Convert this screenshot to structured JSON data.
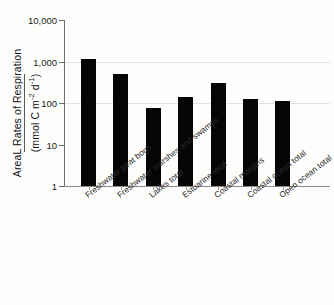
{
  "chart_data": {
    "type": "bar",
    "title": "",
    "subtitle": "",
    "xlabel": "",
    "ylabel": "AreaL Rates of Respiration (mmol C m-2 d-1)",
    "ylabel_line1": "AreaL Rates of Respiration",
    "ylabel_line2_prefix": "(mmol C m",
    "ylabel_line2_exp1": "-2",
    "ylabel_line2_mid": " d",
    "ylabel_line2_exp2": "-1",
    "ylabel_line2_suffix": ")",
    "scale": "log",
    "ylim": [
      1,
      10000
    ],
    "yticks": [
      1,
      10,
      100,
      1000,
      10000
    ],
    "ytick_labels": [
      "1",
      "10",
      "100",
      "1,000",
      "10,000"
    ],
    "gridlines_at": [
      100,
      1000
    ],
    "grid": true,
    "legend": "none",
    "bar_color": "#050505",
    "categories": [
      "Freshwater peat bogs",
      "Freshwater marshes and swamps",
      "Lakes total",
      "Estuarine total",
      "Coastal margins",
      "Coastal ocean total",
      "Open ocean total"
    ],
    "values": [
      1150,
      500,
      78,
      140,
      300,
      122,
      110
    ]
  },
  "axis": {
    "y_title_line1": "AreaL Rates of Respiration",
    "y_unit_open": "(mmol C m",
    "y_unit_exp1": "-2",
    "y_unit_mid": " d",
    "y_unit_exp2": "-1",
    "y_unit_close": ")"
  }
}
